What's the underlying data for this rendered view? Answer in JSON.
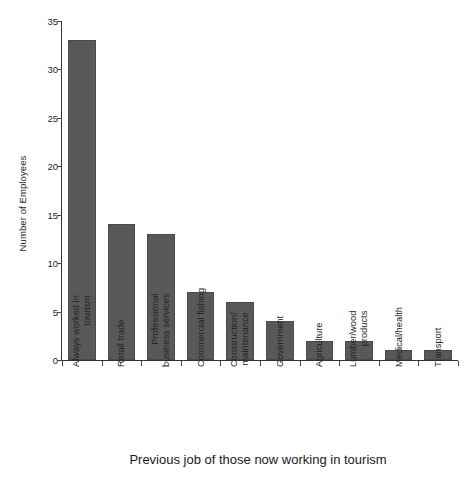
{
  "chart_data": {
    "type": "bar",
    "title": "",
    "xlabel": "Previous job of those now working in tourism",
    "ylabel": "Number of Employees",
    "categories": [
      "Always worked in tourism",
      "Retail trade",
      "Professional business services",
      "Commercial fishing",
      "Construction/ maintenance",
      "Government",
      "Agriculture",
      "Lumber/wood products",
      "Medical/health",
      "Transport"
    ],
    "category_lines": [
      [
        "Always worked in",
        "tourism"
      ],
      [
        "Retail trade",
        ""
      ],
      [
        "Professional",
        "business services"
      ],
      [
        "Commercial fishing",
        ""
      ],
      [
        "Construction/",
        "maintenance"
      ],
      [
        "Government",
        ""
      ],
      [
        "Agriculture",
        ""
      ],
      [
        "Lumber/wood",
        "products"
      ],
      [
        "Medical/health",
        ""
      ],
      [
        "Transport",
        ""
      ]
    ],
    "values": [
      33,
      14,
      13,
      7,
      6,
      4,
      2,
      2,
      1,
      1
    ],
    "ylim": [
      0,
      35
    ],
    "yticks": [
      0,
      5,
      10,
      15,
      20,
      25,
      30,
      35
    ],
    "ytick_labels": [
      "0",
      "5",
      "10",
      "15",
      "20",
      "25",
      "30",
      "35"
    ],
    "grid": false,
    "legend": false,
    "bar_color": "#595959",
    "axis_color": "#333333",
    "background": "#ffffff"
  }
}
